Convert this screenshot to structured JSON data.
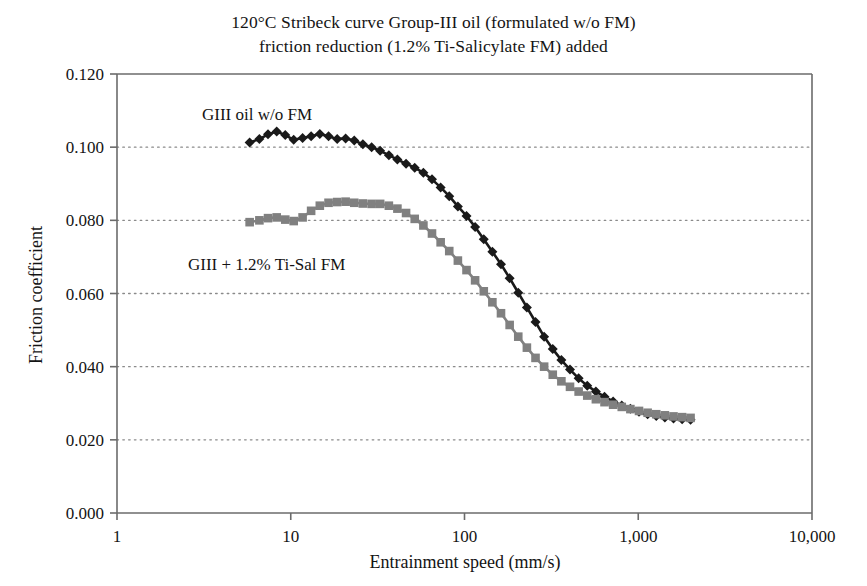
{
  "chart": {
    "title_lines": [
      "120°C Stribeck curve Group-III oil (formulated w/o FM)",
      "friction reduction (1.2% Ti-Salicylate FM) added"
    ],
    "xlabel": "Entrainment speed (mm/s)",
    "ylabel": "Friction coefficient",
    "x_tick_labels": [
      "1",
      "10",
      "100",
      "1,000",
      "10,000"
    ],
    "y_tick_labels": [
      "0.000",
      "0.020",
      "0.040",
      "0.060",
      "0.080",
      "0.100",
      "0.120"
    ],
    "annotation_black": "GIII oil w/o FM",
    "annotation_gray": "GIII + 1.2% Ti-Sal FM",
    "color_black": "#1a1a1a",
    "color_gray": "#808080",
    "color_axis": "#6b6b6b",
    "color_grid": "#8a8a8a"
  },
  "chart_data": {
    "type": "line",
    "title": "120°C Stribeck curve Group-III oil (formulated w/o FM) friction reduction (1.2% Ti-Salicylate FM) added",
    "xlabel": "Entrainment speed (mm/s)",
    "ylabel": "Friction coefficient",
    "xscale": "log",
    "xlim": [
      1,
      10000
    ],
    "ylim": [
      0.0,
      0.12
    ],
    "xticks": [
      1,
      10,
      100,
      1000,
      10000
    ],
    "xticklabels": [
      "1",
      "10",
      "100",
      "1,000",
      "10,000"
    ],
    "yticks": [
      0.0,
      0.02,
      0.04,
      0.06,
      0.08,
      0.1,
      0.12
    ],
    "yticklabels": [
      "0.000",
      "0.020",
      "0.040",
      "0.060",
      "0.080",
      "0.100",
      "0.120"
    ],
    "grid": "horizontal-dotted",
    "legend": "inline-annotations",
    "series": [
      {
        "name": "GIII oil w/o FM",
        "marker": "diamond",
        "color": "#1a1a1a",
        "points": [
          [
            5.8,
            0.1013
          ],
          [
            6.6,
            0.1022
          ],
          [
            7.4,
            0.1035
          ],
          [
            8.3,
            0.1043
          ],
          [
            9.3,
            0.1033
          ],
          [
            10.4,
            0.102
          ],
          [
            11.7,
            0.1025
          ],
          [
            13.1,
            0.103
          ],
          [
            14.7,
            0.1036
          ],
          [
            16.5,
            0.103
          ],
          [
            18.5,
            0.1022
          ],
          [
            20.7,
            0.1024
          ],
          [
            23.2,
            0.1018
          ],
          [
            26.0,
            0.1008
          ],
          [
            29.2,
            0.1
          ],
          [
            32.7,
            0.099
          ],
          [
            36.7,
            0.0978
          ],
          [
            41.1,
            0.0966
          ],
          [
            46.1,
            0.0955
          ],
          [
            51.7,
            0.0944
          ],
          [
            58.0,
            0.093
          ],
          [
            65.0,
            0.0912
          ],
          [
            72.9,
            0.089
          ],
          [
            81.7,
            0.0866
          ],
          [
            91.6,
            0.0838
          ],
          [
            102.7,
            0.0812
          ],
          [
            115.1,
            0.0782
          ],
          [
            129.1,
            0.0748
          ],
          [
            144.7,
            0.0714
          ],
          [
            162.2,
            0.068
          ],
          [
            181.9,
            0.0642
          ],
          [
            203.9,
            0.0602
          ],
          [
            228.6,
            0.0562
          ],
          [
            256.3,
            0.0522
          ],
          [
            287.3,
            0.0482
          ],
          [
            322.1,
            0.0448
          ],
          [
            361.1,
            0.0418
          ],
          [
            404.8,
            0.0392
          ],
          [
            453.9,
            0.0368
          ],
          [
            508.8,
            0.0348
          ],
          [
            570.4,
            0.0332
          ],
          [
            639.5,
            0.0318
          ],
          [
            716.9,
            0.0305
          ],
          [
            803.7,
            0.0294
          ],
          [
            901.0,
            0.0285
          ],
          [
            1010.0,
            0.0277
          ],
          [
            1132.4,
            0.027
          ],
          [
            1269.4,
            0.0265
          ],
          [
            1423.0,
            0.0261
          ],
          [
            1595.4,
            0.0258
          ],
          [
            1788.0,
            0.0256
          ],
          [
            2000.0,
            0.0255
          ]
        ]
      },
      {
        "name": "GIII + 1.2% Ti-Sal FM",
        "marker": "square",
        "color": "#808080",
        "points": [
          [
            5.8,
            0.0795
          ],
          [
            6.6,
            0.08
          ],
          [
            7.4,
            0.0806
          ],
          [
            8.3,
            0.0808
          ],
          [
            9.3,
            0.0802
          ],
          [
            10.4,
            0.0798
          ],
          [
            11.7,
            0.0808
          ],
          [
            13.1,
            0.0826
          ],
          [
            14.7,
            0.084
          ],
          [
            16.5,
            0.0848
          ],
          [
            18.5,
            0.085
          ],
          [
            20.7,
            0.0851
          ],
          [
            23.2,
            0.0848
          ],
          [
            26.0,
            0.0846
          ],
          [
            29.2,
            0.0845
          ],
          [
            32.7,
            0.0845
          ],
          [
            36.7,
            0.084
          ],
          [
            41.1,
            0.0832
          ],
          [
            46.1,
            0.082
          ],
          [
            51.7,
            0.0804
          ],
          [
            58.0,
            0.0786
          ],
          [
            65.0,
            0.0764
          ],
          [
            72.9,
            0.074
          ],
          [
            81.7,
            0.0716
          ],
          [
            91.6,
            0.069
          ],
          [
            102.7,
            0.0664
          ],
          [
            115.1,
            0.0636
          ],
          [
            129.1,
            0.0606
          ],
          [
            144.7,
            0.0576
          ],
          [
            162.2,
            0.0546
          ],
          [
            181.9,
            0.0514
          ],
          [
            203.9,
            0.0482
          ],
          [
            228.6,
            0.0452
          ],
          [
            256.3,
            0.0424
          ],
          [
            287.3,
            0.04
          ],
          [
            322.1,
            0.0378
          ],
          [
            361.1,
            0.036
          ],
          [
            404.8,
            0.0345
          ],
          [
            453.9,
            0.0332
          ],
          [
            508.8,
            0.0321
          ],
          [
            570.4,
            0.0311
          ],
          [
            639.5,
            0.0303
          ],
          [
            716.9,
            0.0296
          ],
          [
            803.7,
            0.029
          ],
          [
            901.0,
            0.0284
          ],
          [
            1010.0,
            0.0279
          ],
          [
            1132.4,
            0.0274
          ],
          [
            1269.4,
            0.027
          ],
          [
            1423.0,
            0.0267
          ],
          [
            1595.4,
            0.0264
          ],
          [
            1788.0,
            0.0262
          ],
          [
            2000.0,
            0.026
          ]
        ]
      }
    ],
    "annotations": [
      {
        "text": "GIII oil w/o FM",
        "x_px": 202,
        "y_px": 120
      },
      {
        "text": "GIII + 1.2% Ti-Sal FM",
        "x_px": 188,
        "y_px": 270
      }
    ]
  }
}
